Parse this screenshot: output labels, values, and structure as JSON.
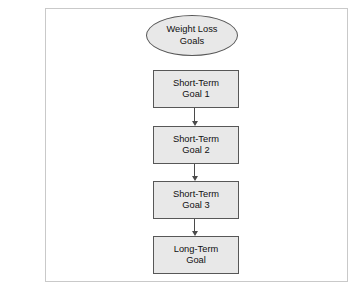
{
  "page": {
    "body_text": {
      "paragraph_1": {
        "lines": [
          "urgets",
          "mple,",
          "g dur-",
          "each",
          "other",
          "e the"
        ]
      },
      "paragraph_2": {
        "lines": [
          "ing a",
          "nealth",
          "male",
          "e first",
          "-term",
          "esired"
        ]
      }
    }
  },
  "figure": {
    "diagram": {
      "type": "flowchart",
      "orientation": "vertical",
      "nodes": [
        {
          "id": "root",
          "shape": "oval",
          "line1": "Weight Loss",
          "line2": "Goals"
        },
        {
          "id": "st1",
          "shape": "rectangle",
          "line1": "Short-Term",
          "line2": "Goal 1"
        },
        {
          "id": "st2",
          "shape": "rectangle",
          "line1": "Short-Term",
          "line2": "Goal 2"
        },
        {
          "id": "st3",
          "shape": "rectangle",
          "line1": "Short-Term",
          "line2": "Goal 3"
        },
        {
          "id": "lt",
          "shape": "rectangle",
          "line1": "Long-Term",
          "line2": "Goal"
        }
      ],
      "connectors": [
        {
          "from": "st1",
          "to": "st2",
          "style": "arrow-down"
        },
        {
          "from": "st2",
          "to": "st3",
          "style": "arrow-down"
        },
        {
          "from": "st3",
          "to": "lt",
          "style": "arrow-down"
        }
      ],
      "colors": {
        "node_fill": "#e8e8e8",
        "node_border": "#575757",
        "connector": "#4a4a4a",
        "frame_border": "#c9c9c9",
        "background": "#ffffff"
      }
    }
  }
}
